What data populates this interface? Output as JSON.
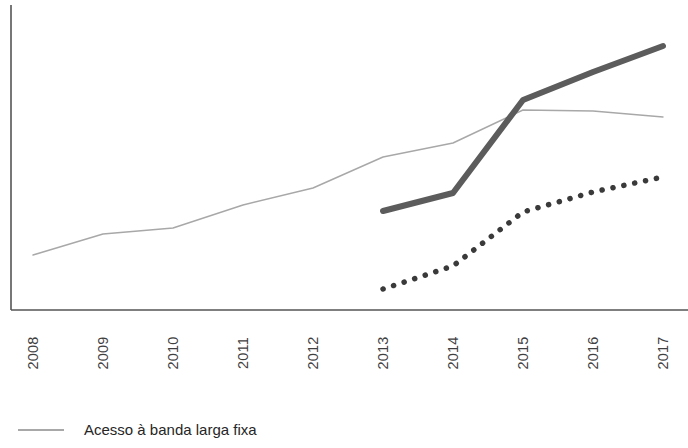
{
  "chart_data": {
    "type": "line",
    "title": "",
    "subtitle": "",
    "xlabel": "",
    "ylabel": "",
    "categories": [
      "2008",
      "2009",
      "2010",
      "2011",
      "2012",
      "2013",
      "2014",
      "2015",
      "2016",
      "2017"
    ],
    "x": [
      2008,
      2009,
      2010,
      2011,
      2012,
      2013,
      2014,
      2015,
      2016,
      2017
    ],
    "xlim": [
      2008,
      2017
    ],
    "ylim": [
      0,
      100
    ],
    "grid": false,
    "legend_position": "bottom-left",
    "axis_ticks_visible": false,
    "y_axis_labels_visible": false,
    "series": [
      {
        "name": "Acesso à banda larga fixa",
        "style": "solid-thin",
        "color": "#a8a8a8",
        "width": 1.4,
        "x": [
          2008,
          2009,
          2010,
          2011,
          2012,
          2013,
          2014,
          2015,
          2016,
          2017
        ],
        "values": [
          18,
          25,
          27,
          34,
          40,
          50,
          55,
          65,
          65,
          63
        ]
      },
      {
        "name": "Série 2",
        "style": "solid-thick",
        "color": "#5c5c5c",
        "width": 6,
        "x": [
          2013,
          2014,
          2015,
          2016,
          2017
        ],
        "values": [
          32,
          38,
          69,
          78,
          86
        ]
      },
      {
        "name": "Série 3",
        "style": "dotted",
        "color": "#3a3a3a",
        "width": 5.5,
        "x": [
          2013,
          2014,
          2015,
          2016,
          2017
        ],
        "values": [
          7,
          14,
          32,
          39,
          44
        ]
      }
    ],
    "pixel_geometry": {
      "x_positions": [
        33,
        103,
        173,
        243,
        313,
        383,
        453,
        523,
        593,
        663
      ],
      "axis_origin_x": 11,
      "axis_baseline_y": 310,
      "axis_top_y": 5,
      "series_pixel_y": {
        "fixed_broadband": [
          255,
          234,
          228,
          205,
          188,
          157,
          143,
          110,
          111,
          117
        ],
        "series_2": [
          211,
          193,
          100,
          72,
          46
        ],
        "series_3": [
          289,
          266,
          212,
          192,
          177
        ]
      }
    }
  },
  "axis": {
    "tick_labels": [
      {
        "label": "2008",
        "cx": 33
      },
      {
        "label": "2009",
        "cx": 103
      },
      {
        "label": "2010",
        "cx": 173
      },
      {
        "label": "2011",
        "cx": 243
      },
      {
        "label": "2012",
        "cx": 313
      },
      {
        "label": "2013",
        "cx": 383
      },
      {
        "label": "2014",
        "cx": 453
      },
      {
        "label": "2015",
        "cx": 523
      },
      {
        "label": "2016",
        "cx": 593
      },
      {
        "label": "2017",
        "cx": 663
      }
    ],
    "line_color": "#555555"
  },
  "legend": {
    "items": [
      {
        "label": "Acesso à banda larga fixa",
        "style": "solid-thin",
        "color": "#a8a8a8"
      }
    ]
  }
}
